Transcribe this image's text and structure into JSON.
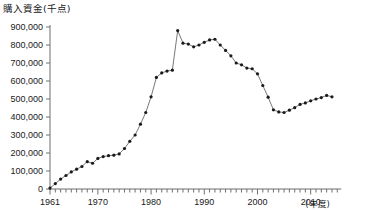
{
  "chart_data": {
    "type": "line",
    "title": "購入資金(千点)",
    "xlabel": "(年度)",
    "ylabel": "",
    "xlim": [
      1960,
      2015
    ],
    "ylim": [
      0,
      900000
    ],
    "grid": false,
    "legend": "none",
    "y_ticks": [
      0,
      100000,
      200000,
      300000,
      400000,
      500000,
      600000,
      700000,
      800000,
      900000
    ],
    "y_tick_labels": [
      "0",
      "100,000",
      "200,000",
      "300,000",
      "400,000",
      "500,000",
      "600,000",
      "700,000",
      "800,000",
      "900,000"
    ],
    "x_ticks": [
      1961,
      1970,
      1980,
      1990,
      2000,
      2010
    ],
    "x_tick_labels": [
      "1961",
      "1970",
      "1980",
      "1990",
      "2000",
      "2010"
    ],
    "x_minor_tick_interval": 1,
    "marker": "filled-circle",
    "marker_color": "#1a1a1a",
    "line_color": "#555555",
    "series": [
      {
        "name": "購入資金",
        "x": [
          1961,
          1962,
          1963,
          1964,
          1965,
          1966,
          1967,
          1968,
          1969,
          1970,
          1971,
          1972,
          1973,
          1974,
          1975,
          1976,
          1977,
          1978,
          1979,
          1980,
          1981,
          1982,
          1983,
          1984,
          1985,
          1986,
          1987,
          1988,
          1989,
          1990,
          1991,
          1992,
          1993,
          1994,
          1995,
          1996,
          1997,
          1998,
          1999,
          2000,
          2001,
          2002,
          2003,
          2004,
          2005,
          2006,
          2007,
          2008,
          2009,
          2010,
          2011,
          2012,
          2013,
          2014
        ],
        "y": [
          5000,
          30000,
          55000,
          75000,
          95000,
          110000,
          125000,
          152000,
          143000,
          170000,
          180000,
          185000,
          188000,
          195000,
          225000,
          265000,
          300000,
          360000,
          425000,
          512000,
          620000,
          645000,
          655000,
          660000,
          880000,
          810000,
          805000,
          790000,
          800000,
          815000,
          828000,
          832000,
          800000,
          770000,
          740000,
          700000,
          690000,
          672000,
          668000,
          640000,
          575000,
          510000,
          440000,
          428000,
          425000,
          438000,
          452000,
          470000,
          478000,
          490000,
          500000,
          508000,
          520000,
          512000
        ]
      }
    ]
  }
}
